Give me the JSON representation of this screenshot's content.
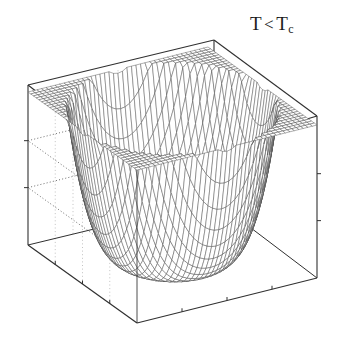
{
  "figure": {
    "title": "",
    "annotation": {
      "name": "temperature-condition-label",
      "symbol": "T",
      "relation": "<",
      "critical_symbol": "T",
      "critical_subscript": "c",
      "full_text": "T < Tc"
    },
    "background_color": "#ffffff",
    "line_color": "#303030",
    "mesh_color": "#4a4a4a",
    "grid_color": "#555555"
  },
  "chart_data": {
    "type": "surface",
    "title": "",
    "subtitle": "",
    "annotations": [
      {
        "text": "T < Tc",
        "x_px": 250,
        "y_px": 14
      }
    ],
    "function": "F(x,y) = a*r^2 + b*r^4 with a<0, b>0 ; r^2 = x^2 + y^2",
    "coefficients": {
      "a": -1.0,
      "b": 1.0,
      "scale": 1.0
    },
    "xlabel": "",
    "ylabel": "",
    "zlabel": "",
    "xlim": [
      -1.6,
      1.6
    ],
    "ylim": [
      -1.6,
      1.6
    ],
    "zlim": [
      -0.3,
      4.1
    ],
    "grid": true,
    "grid_style": "dotted",
    "grid_walls": [
      "left",
      "right",
      "back-left",
      "back-right"
    ],
    "z_gridline_levels": [
      1.35,
      2.7
    ],
    "x_ticks": [
      -1.6,
      -0.8,
      0.0,
      0.8,
      1.6
    ],
    "y_ticks": [
      -1.6,
      -0.8,
      0.0,
      0.8,
      1.6
    ],
    "z_ticks": [
      0.0,
      1.35,
      2.7,
      4.05
    ],
    "tick_labels_visible": false,
    "mesh_resolution": {
      "nx": 40,
      "ny": 40
    },
    "legend": null,
    "legend_position": "none",
    "box_visible": true,
    "view": {
      "azimuth": -52,
      "elevation": 26
    },
    "minimum_radius": 0.707,
    "central_maximum_value": 0.0,
    "minimum_value": -0.25,
    "corner_peak_value": 4.05
  },
  "box": {
    "corners_px": {
      "top_left": [
        28,
        85
      ],
      "top_back": [
        214,
        40
      ],
      "top_right": [
        317,
        116
      ],
      "top_front": [
        137,
        170
      ],
      "bottom_left": [
        28,
        245
      ],
      "bottom_back": [
        214,
        200
      ],
      "bottom_right": [
        317,
        278
      ],
      "bottom_front": [
        137,
        323
      ]
    }
  }
}
